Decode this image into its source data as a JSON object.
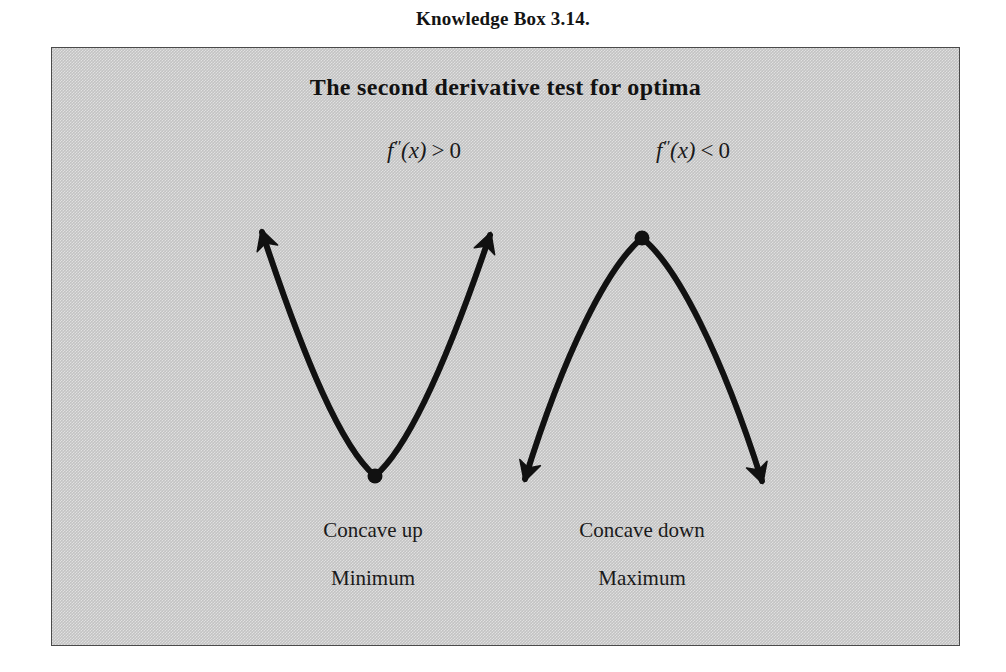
{
  "caption": {
    "label": "Knowledge Box 3.14."
  },
  "box": {
    "title": "The second derivative test for optima",
    "fill_color": "#c3c3c3",
    "border_color": "#4a4a4a"
  },
  "conditions": {
    "left": {
      "function": "f",
      "primes": "″",
      "argument": "(x)",
      "operator": ">",
      "value": "0",
      "full": "f''(x) > 0"
    },
    "right": {
      "function": "f",
      "primes": "″",
      "argument": "(x)",
      "operator": "<",
      "value": "0",
      "full": "f''(x) < 0"
    }
  },
  "captions": {
    "left": {
      "concavity": "Concave up",
      "optimum": "Minimum"
    },
    "right": {
      "concavity": "Concave down",
      "optimum": "Maximum"
    }
  },
  "figure": {
    "stroke_color": "#111111",
    "stroke_width": 6,
    "left_curve": {
      "type": "parabola-up",
      "vertex": [
        323,
        428
      ],
      "left_end": [
        210,
        184
      ],
      "right_end": [
        438,
        187
      ],
      "marker": "filled-dot"
    },
    "right_curve": {
      "type": "parabola-down",
      "vertex": [
        590,
        190
      ],
      "left_end": [
        473,
        431
      ],
      "right_end": [
        710,
        433
      ],
      "marker": "filled-dot"
    }
  }
}
